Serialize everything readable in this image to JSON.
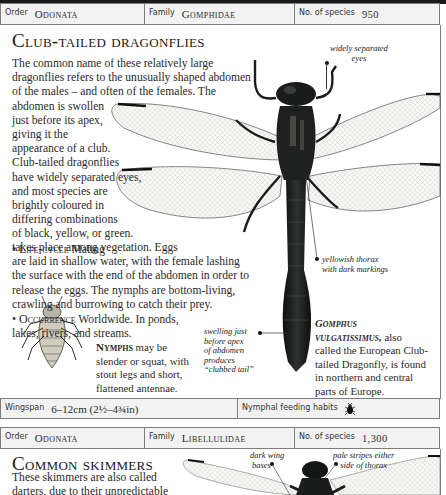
{
  "entry1": {
    "header": {
      "order_label": "Order",
      "order_value": "Odonata",
      "family_label": "Family",
      "family_value": "Gomphidae",
      "species_label": "No. of species",
      "species_value": "950"
    },
    "title": "Club-tailed dragonflies",
    "body": {
      "line1": "The common name of these relatively large",
      "line2": "dragonflies refers to the unusually shaped abdomen",
      "line3": "of the males – and often of the females. The",
      "line4": "abdomen is swollen",
      "line5": "just before its apex,",
      "line6": "giving it the",
      "line7": "appearance of a club.",
      "line8": "Club-tailed dragonflies",
      "line9": "have widely separated eyes,",
      "line10": "and most species are",
      "line11": "brightly coloured in",
      "line12": "differing combinations",
      "line13": "of black, yellow, or green.",
      "lifecycle_bullet": "•",
      "lifecycle_heading": "Life-cycle",
      "lifecycle_line1": "Mating",
      "line14": "takes place among vegetation. Eggs",
      "line15": "are laid in shallow water, with the female lashing",
      "line16": "the surface with the end of the abdomen in order to",
      "line17": "release the eggs. The nymphs are bottom-living,",
      "line18": "crawling and burrowing to catch their prey.",
      "occurrence_bullet": "•",
      "occurrence_heading": "Occurrence",
      "occurrence_line1": "Worldwide. In ponds,",
      "line19": "lakes, rivers, and streams."
    },
    "annotations": {
      "eyes": [
        "widely separated",
        "eyes"
      ],
      "thorax": [
        "yellowish thorax",
        "with dark markings"
      ],
      "tail": [
        "swelling just",
        "before apex",
        "of abdomen",
        "produces",
        "“clubbed tail”"
      ]
    },
    "nymph_caption": {
      "heading": "Nymphs",
      "line1": "may be",
      "line2": "slender or squat, with",
      "line3": "stout legs and short,",
      "line4": "flattened antennae."
    },
    "species_caption": {
      "name1": "Gomphus",
      "name2": "vulgatissimus,",
      "line1": "also",
      "line2": "called the European Club-",
      "line3": "tailed Dragonfly, is found",
      "line4": "in northern and central",
      "line5": "parts of Europe."
    },
    "footer": {
      "wingspan_label": "Wingspan",
      "wingspan_value": "6–12cm (2½–4¾in)",
      "feeding_label": "Nymphal feeding habits",
      "feeding_icon": "beetle-icon"
    }
  },
  "entry2": {
    "header": {
      "order_label": "Order",
      "order_value": "Odonata",
      "family_label": "Family",
      "family_value": "Libellulidae",
      "species_label": "No. of species",
      "species_value": "1,300"
    },
    "title": "Common skimmers",
    "body": {
      "line1": "These skimmers are also called",
      "line2": "darters, due to their unpredictable",
      "line3": "flight pattern. Many species are stout-"
    },
    "annotations": {
      "wing_bases": [
        "dark wing",
        "bases"
      ],
      "stripes": [
        "pale stripes either",
        "side of thorax"
      ]
    }
  },
  "colors": {
    "header_bg": "#f2f2f2",
    "border": "#7d7d7d",
    "text": "#2a2a2a",
    "insect_dark": "#1b1d1c"
  }
}
